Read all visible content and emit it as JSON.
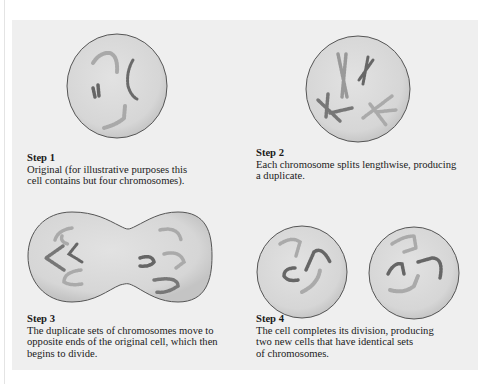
{
  "figure": {
    "colors": {
      "page_background": "#ffffff",
      "panel_background": "#efefef",
      "cell_fill": "#d9d9d9",
      "cell_outline": "#555555",
      "chromosome_dark": "#6a6a6a",
      "chromosome_light": "#a8a8a8"
    },
    "steps": [
      {
        "title": "Step 1",
        "text": "Original (for illustrative purposes this\ncell contains but four chromosomes).",
        "illustration": "single round cell with four chromosomes"
      },
      {
        "title": "Step 2",
        "text": "Each chromosome splits lengthwise, producing\na duplicate.",
        "illustration": "round cell with four X-shaped duplicated chromosomes"
      },
      {
        "title": "Step 3",
        "text": "The duplicate sets of chromosomes move to\nopposite ends of the original cell, which then\nbegins to divide.",
        "illustration": "dumbbell-shaped dividing cell with chromosome sets at each end"
      },
      {
        "title": "Step 4",
        "text": "The cell completes its division, producing\ntwo new cells that have identical sets\nof chromosomes.",
        "illustration": "two separate round daughter cells each with four chromosomes"
      }
    ]
  }
}
